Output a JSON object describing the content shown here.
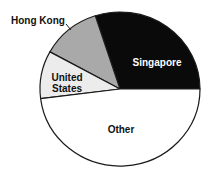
{
  "chart_data": {
    "type": "pie",
    "title": "",
    "categories": [
      "Singapore",
      "Hong Kong",
      "United States",
      "Other"
    ],
    "values": [
      30,
      12,
      10,
      48
    ],
    "unit": "percent (estimated from slice angles)",
    "colors": [
      "#0a0a0a",
      "#a9a9a9",
      "#ececec",
      "#ffffff"
    ],
    "label_colors": [
      "#ffffff",
      "#111111",
      "#111111",
      "#111111"
    ],
    "start_angle_deg": 0,
    "direction": "counterclockwise",
    "legend": "none (direct labels)",
    "annotations": [
      {
        "text": "Hong Kong",
        "placement": "outside with leader line"
      }
    ]
  },
  "labels": {
    "singapore": "Singapore",
    "hong_kong": "Hong Kong",
    "united_states_line1": "United",
    "united_states_line2": "States",
    "other": "Other"
  }
}
